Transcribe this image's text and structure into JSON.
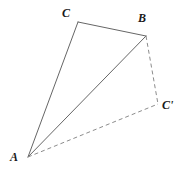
{
  "figure": {
    "name": "triangle-rotation-diagram",
    "background_color": "#ffffff",
    "stroke_color": "#666666",
    "dash_color": "#8c8c8c",
    "label_color": "#1a1a1a",
    "stroke_width": 1,
    "viewbox": {
      "width": 184,
      "height": 173
    },
    "points": {
      "A": {
        "label": "A",
        "x": 28,
        "y": 157
      },
      "B": {
        "label": "B",
        "x": 146,
        "y": 36
      },
      "C": {
        "label": "C",
        "x": 78,
        "y": 22
      },
      "Cp": {
        "label": "C'",
        "x": 158,
        "y": 104
      }
    },
    "segments": [
      {
        "name": "segment-A-C",
        "from": "A",
        "to": "C",
        "style": "solid"
      },
      {
        "name": "segment-C-B",
        "from": "C",
        "to": "B",
        "style": "solid"
      },
      {
        "name": "segment-A-B",
        "from": "A",
        "to": "B",
        "style": "solid"
      },
      {
        "name": "segment-B-Cprime",
        "from": "B",
        "to": "Cp",
        "style": "dashed"
      },
      {
        "name": "segment-A-Cprime",
        "from": "A",
        "to": "Cp",
        "style": "dashed"
      }
    ],
    "labels": {
      "A": "A",
      "B": "B",
      "C": "C",
      "C_prime": "C'"
    }
  }
}
